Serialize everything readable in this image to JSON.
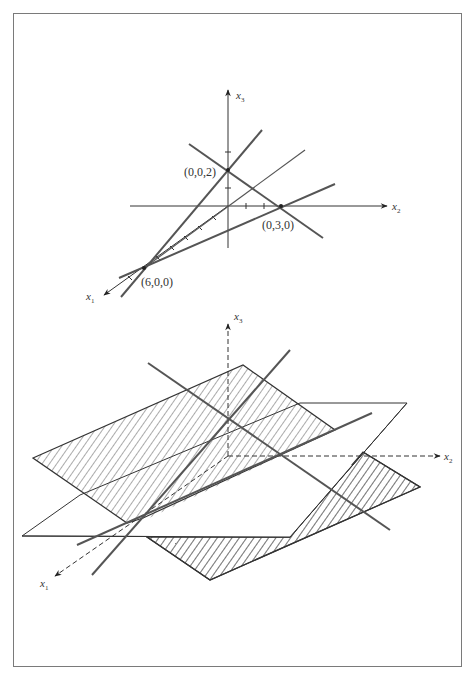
{
  "figure": {
    "top_diagram": {
      "axes": {
        "x1_label": "x",
        "x1_sub": "1",
        "x2_label": "x",
        "x2_sub": "2",
        "x3_label": "x",
        "x3_sub": "3"
      },
      "points": [
        {
          "label": "(0,0,2)"
        },
        {
          "label": "(0,3,0)"
        },
        {
          "label": "(6,0,0)"
        }
      ]
    },
    "bottom_diagram": {
      "axes": {
        "x1_label": "x",
        "x1_sub": "1",
        "x2_label": "x",
        "x2_sub": "2",
        "x3_label": "x",
        "x3_sub": "3"
      }
    },
    "colors": {
      "line": "#555555",
      "axis": "#333333",
      "frame": "#7a7a7a",
      "background": "#ffffff"
    }
  }
}
